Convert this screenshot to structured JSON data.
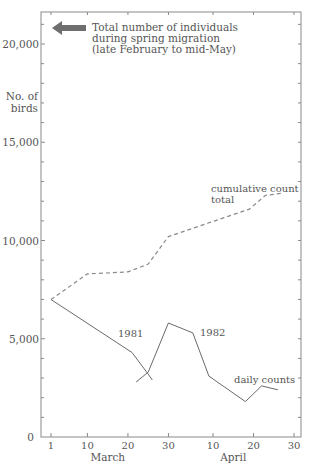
{
  "chart_data": {
    "type": "line",
    "title": "",
    "annotation": {
      "arrow": "left-arrow",
      "lines": [
        "Total number of individuals",
        "during spring migration",
        "(late February to mid-May)"
      ]
    },
    "ylabel": [
      "No. of",
      "birds"
    ],
    "xlabel": "",
    "ylim": [
      0,
      21500
    ],
    "yticks": [
      {
        "value": 0,
        "label": "0"
      },
      {
        "value": 5000,
        "label": "5,000"
      },
      {
        "value": 10000,
        "label": "10,000"
      },
      {
        "value": 15000,
        "label": "15,000"
      },
      {
        "value": 20000,
        "label": "20,000"
      }
    ],
    "xticks": [
      {
        "day": 1,
        "label": "1"
      },
      {
        "day": 10,
        "label": "10"
      },
      {
        "day": 20,
        "label": "20"
      },
      {
        "day": 30,
        "label": "30"
      },
      {
        "day": 41,
        "label": "10"
      },
      {
        "day": 51,
        "label": "20"
      },
      {
        "day": 61,
        "label": "30"
      }
    ],
    "month_labels": [
      {
        "day": 16,
        "label": "March"
      },
      {
        "day": 46,
        "label": "April"
      }
    ],
    "grid": false,
    "series": [
      {
        "name": "cumulative count total",
        "style": "dashed",
        "label_lines": [
          "cumulative count",
          "total"
        ],
        "points": [
          [
            1,
            7000
          ],
          [
            10,
            8300
          ],
          [
            20,
            8400
          ],
          [
            25,
            8800
          ],
          [
            30,
            10200
          ],
          [
            40,
            10900
          ],
          [
            50,
            11600
          ],
          [
            54,
            12300
          ],
          [
            58,
            12400
          ]
        ]
      },
      {
        "name": "1981",
        "style": "solid",
        "label_lines": [
          "1981"
        ],
        "points": [
          [
            1,
            7000
          ],
          [
            21,
            4300
          ],
          [
            25,
            3200
          ],
          [
            26,
            2900
          ]
        ]
      },
      {
        "name": "1982",
        "style": "solid",
        "label_lines": [
          "1982"
        ],
        "points": [
          [
            22,
            2800
          ],
          [
            25,
            3300
          ],
          [
            30,
            5800
          ],
          [
            36,
            5300
          ],
          [
            40,
            3100
          ],
          [
            49,
            1800
          ],
          [
            53,
            2600
          ],
          [
            57,
            2400
          ]
        ]
      }
    ],
    "series_annotation": "daily counts"
  }
}
